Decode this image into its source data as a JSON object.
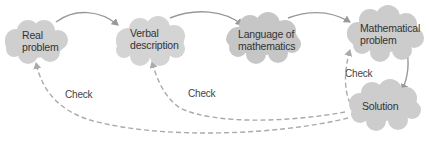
{
  "diagram": {
    "colors": {
      "cloud_fill": "#c8c8c8",
      "cloud_fill_light": "#d6d6d6",
      "arrow": "#999999",
      "dashed_arrow": "#aaaaaa",
      "text": "#333333",
      "background": "#ffffff"
    },
    "nodes": [
      {
        "id": "real-problem",
        "line1": "Real",
        "line2": "problem"
      },
      {
        "id": "verbal-description",
        "line1": "Verbal",
        "line2": "description"
      },
      {
        "id": "language-of-mathematics",
        "line1": "Language of",
        "line2": "mathematics"
      },
      {
        "id": "mathematical-problem",
        "line1": "Mathematical",
        "line2": "problem"
      },
      {
        "id": "solution",
        "line1": "Solution",
        "line2": ""
      }
    ],
    "flow_arrows": [
      {
        "from": "Real problem",
        "to": "Verbal description"
      },
      {
        "from": "Verbal description",
        "to": "Language of mathematics"
      },
      {
        "from": "Language of mathematics",
        "to": "Mathematical problem"
      },
      {
        "from": "Mathematical problem",
        "to": "Solution"
      }
    ],
    "check_arrows": [
      {
        "from": "Solution",
        "to": "Mathematical problem",
        "label": "Check"
      },
      {
        "from": "Solution",
        "to": "Verbal description",
        "label": "Check"
      },
      {
        "from": "Solution",
        "to": "Real problem",
        "label": "Check"
      }
    ]
  }
}
